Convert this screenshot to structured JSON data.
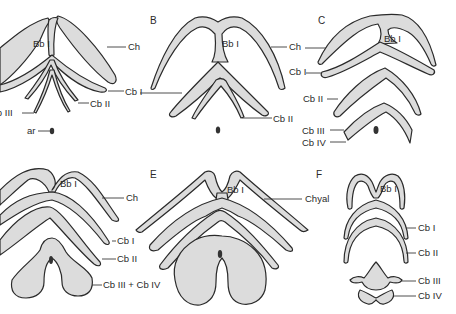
{
  "figure": {
    "panels": [
      {
        "id": "A",
        "letter": "",
        "labels": {
          "bb": "Bb I",
          "ch": "Ch",
          "cb1": "Cb I",
          "cb2": "Cb II",
          "cb3": "Cb III",
          "ar": "ar"
        }
      },
      {
        "id": "B",
        "letter": "B",
        "labels": {
          "bb": "Bb I",
          "ch": "Ch",
          "cb1": "Cb I",
          "cb2": "Cb II"
        }
      },
      {
        "id": "C",
        "letter": "C",
        "labels": {
          "bb": "Bb I",
          "ch": "Ch",
          "cb1": "Cb I",
          "cb2": "Cb II",
          "cb3": "Cb III",
          "cb4": "Cb IV"
        }
      },
      {
        "id": "D",
        "letter": "",
        "labels": {
          "bb": "Bb I",
          "ch": "Ch",
          "cb1": "Cb I",
          "cb2": "Cb II",
          "cb34": "Cb III + Cb IV"
        }
      },
      {
        "id": "E",
        "letter": "E",
        "labels": {
          "bb": "Bb I",
          "chyal": "Chyal"
        }
      },
      {
        "id": "F",
        "letter": "F",
        "labels": {
          "bb": "Bb I",
          "cb1": "Cb I",
          "cb2": "Cb II",
          "cb3": "Cb III",
          "cb4": "Cb IV"
        }
      }
    ]
  }
}
